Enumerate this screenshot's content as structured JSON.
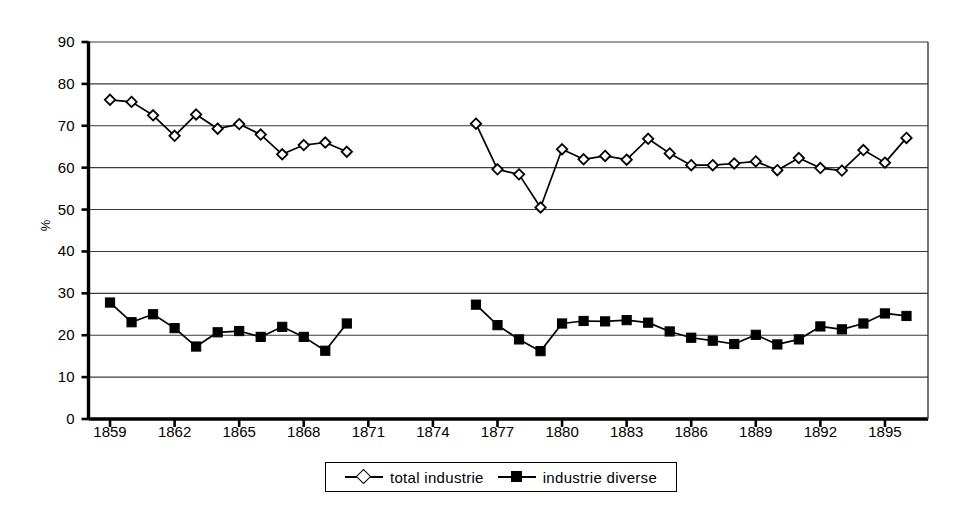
{
  "chart_data": {
    "type": "line",
    "title": "",
    "subtitle": "",
    "xlabel": "",
    "ylabel": "%",
    "xlim": [
      1858,
      1897
    ],
    "ylim": [
      0,
      90
    ],
    "ytick_step": 10,
    "xtick_step": 3,
    "grid": true,
    "grid_axis": "y",
    "legend_position": "bottom-center",
    "ytick_labels": [
      "90",
      "80",
      "70",
      "60",
      "50",
      "40",
      "30",
      "20",
      "10",
      "0"
    ],
    "ytick_values": [
      90,
      80,
      70,
      60,
      50,
      40,
      30,
      20,
      10,
      0
    ],
    "xtick_labels": [
      "1859",
      "1862",
      "1865",
      "1868",
      "1871",
      "1874",
      "1877",
      "1880",
      "1883",
      "1886",
      "1889",
      "1892",
      "1895"
    ],
    "xtick_values": [
      1859,
      1862,
      1865,
      1868,
      1871,
      1874,
      1877,
      1880,
      1883,
      1886,
      1889,
      1892,
      1895
    ],
    "series": [
      {
        "name": "total  industrie",
        "marker": "diamond-open",
        "color": "#000000",
        "x": [
          1859,
          1860,
          1861,
          1862,
          1863,
          1864,
          1865,
          1866,
          1867,
          1868,
          1869,
          1870,
          1876,
          1877,
          1878,
          1879,
          1880,
          1881,
          1882,
          1883,
          1884,
          1885,
          1886,
          1887,
          1888,
          1889,
          1890,
          1891,
          1892,
          1893,
          1894,
          1895,
          1896
        ],
        "values": [
          76.2,
          75.7,
          72.5,
          67.6,
          72.7,
          69.3,
          70.4,
          67.9,
          63.2,
          65.4,
          66.0,
          63.8,
          70.5,
          59.6,
          58.4,
          50.5,
          64.4,
          62.0,
          62.8,
          61.9,
          66.9,
          63.4,
          60.6,
          60.6,
          61.0,
          61.5,
          59.4,
          62.3,
          59.9,
          59.3,
          64.2,
          61.2,
          67.1
        ]
      },
      {
        "name": "industrie  diverse",
        "marker": "square-filled",
        "color": "#000000",
        "x": [
          1859,
          1860,
          1861,
          1862,
          1863,
          1864,
          1865,
          1866,
          1867,
          1868,
          1869,
          1870,
          1876,
          1877,
          1878,
          1879,
          1880,
          1881,
          1882,
          1883,
          1884,
          1885,
          1886,
          1887,
          1888,
          1889,
          1890,
          1891,
          1892,
          1893,
          1894,
          1895,
          1896
        ],
        "values": [
          27.8,
          23.1,
          25.0,
          21.7,
          17.3,
          20.7,
          21.0,
          19.6,
          22.0,
          19.6,
          16.3,
          22.8,
          27.3,
          22.4,
          19.0,
          16.2,
          22.8,
          23.4,
          23.3,
          23.6,
          23.0,
          20.9,
          19.4,
          18.7,
          17.9,
          20.1,
          17.8,
          19.0,
          22.1,
          21.4,
          22.8,
          25.2,
          24.6
        ]
      }
    ],
    "gap": {
      "after_year": 1870,
      "before_year": 1876,
      "note": "no data plotted 1871-1875"
    }
  },
  "legend": {
    "entries": [
      {
        "label": "total  industrie",
        "marker": "diamond-open"
      },
      {
        "label": "industrie  diverse",
        "marker": "square-filled"
      }
    ]
  },
  "axis": {
    "ylabel": "%"
  }
}
